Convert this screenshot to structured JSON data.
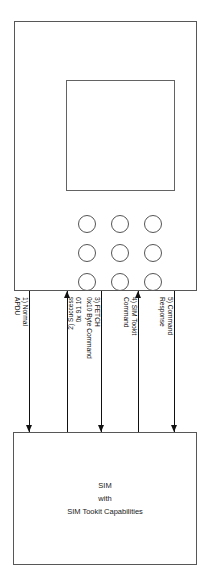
{
  "diagram": {
    "terminal": {
      "name": "mobile-phone",
      "keys": [
        "key-1",
        "key-2",
        "key-3",
        "key-4",
        "key-5",
        "key-6",
        "key-7",
        "key-8",
        "key-9"
      ]
    },
    "sim": {
      "lines": [
        "SIM",
        "with",
        "SIM Tookit Capabilities"
      ]
    },
    "messages": [
      {
        "index": "1",
        "direction": "down",
        "x": 29,
        "orientation": "cw",
        "lines": [
          "1) Normal",
          "APDU"
        ]
      },
      {
        "index": "2",
        "direction": "up",
        "x": 67,
        "orientation": "ccw",
        "lines": [
          "2) Success",
          "0x 91 10"
        ]
      },
      {
        "index": "3",
        "direction": "down",
        "x": 101,
        "orientation": "cw",
        "lines": [
          "3) FETCH",
          "0x10 Byte Command"
        ]
      },
      {
        "index": "4",
        "direction": "up",
        "x": 138,
        "orientation": "cw",
        "lines": [
          "4) SIM Tookit",
          "Command"
        ]
      },
      {
        "index": "5",
        "direction": "down",
        "x": 174,
        "orientation": "cw",
        "lines": [
          "5) Command",
          "Response"
        ]
      }
    ]
  },
  "colors": {
    "stroke": "#575757",
    "arrow": "#111111",
    "text": "#1a1a1a",
    "background": "#ffffff"
  }
}
